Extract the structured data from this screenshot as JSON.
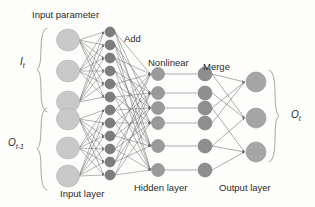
{
  "figure": {
    "type": "neural-network-architecture-diagram",
    "background_color": "#fdfdfc",
    "width": 315,
    "height": 207
  },
  "labels": {
    "input_parameter": "Input parameter",
    "add": "Add",
    "nonlinear": "Nonlinear",
    "merge": "Merge",
    "input_layer": "Input layer",
    "hidden_layer": "Hidden layer",
    "output_layer": "Output layer",
    "input_current": "I",
    "input_current_sub": "t",
    "input_previous": "O",
    "input_previous_sub": "t-1",
    "output": "O",
    "output_sub": "t"
  },
  "colors": {
    "input_node": "#c9c9c9",
    "input_node_stroke": "#b4b4b4",
    "add_node": "#7d7d7d",
    "add_node_stroke": "#6a6a6a",
    "nonlinear_node": "#9a9a9a",
    "nonlinear_node_stroke": "#858585",
    "merge_node": "#8e8e8e",
    "merge_node_stroke": "#7a7a7a",
    "output_node": "#a5a5a5",
    "output_node_stroke": "#909090",
    "edge": "#6b6b6b",
    "brace": "#9d9d9d",
    "text": "#2b2b2b"
  },
  "chart_data": {
    "type": "diagram",
    "columns": [
      {
        "name": "input-layer",
        "label": "Input layer",
        "x": 68,
        "radius": 11,
        "groups": [
          {
            "name": "I_t",
            "count": 3,
            "y": [
              40,
              71,
              102
            ]
          },
          {
            "name": "O_t-1",
            "count": 3,
            "y": [
              119,
              148,
              176
            ]
          }
        ]
      },
      {
        "name": "add-column",
        "label": "Add",
        "x": 110,
        "radius": 5,
        "groups": [
          {
            "name": "add-top",
            "count": 6,
            "y": [
              32,
              45,
              58,
              71,
              84,
              97
            ]
          },
          {
            "name": "add-bottom",
            "count": 6,
            "y": [
              110,
              123,
              136,
              149,
              162,
              175
            ]
          }
        ]
      },
      {
        "name": "nonlinear-column",
        "label": "Nonlinear",
        "x": 158,
        "radius": 6.5,
        "groups": [
          {
            "name": "nonlinear",
            "count": 6,
            "y": [
              74,
              93,
              108,
              123,
              146,
              170
            ]
          }
        ]
      },
      {
        "name": "merge-column",
        "label": "Merge",
        "x": 205,
        "radius": 7,
        "groups": [
          {
            "name": "merge",
            "count": 6,
            "y": [
              74,
              93,
              108,
              123,
              146,
              170
            ]
          }
        ]
      },
      {
        "name": "output-layer",
        "label": "Output layer",
        "x": 256,
        "radius": 10,
        "groups": [
          {
            "name": "O_t",
            "count": 3,
            "y": [
              82,
              118,
              152
            ]
          }
        ]
      }
    ],
    "edges": [
      {
        "from": "input-layer",
        "to": "add-column",
        "pattern": "fully-connected-within-group"
      },
      {
        "from": "add-column",
        "to": "nonlinear-column",
        "pattern": "crossing-bundles"
      },
      {
        "from": "nonlinear-column",
        "to": "merge-column",
        "pattern": "one-to-one-horizontal"
      },
      {
        "from": "merge-column",
        "to": "output-layer",
        "pattern": "crossing-to-outputs"
      }
    ],
    "braces": [
      {
        "name": "brace-input-current",
        "label": "I_t",
        "side": "left",
        "x": 38,
        "y_top": 28,
        "y_bottom": 112
      },
      {
        "name": "brace-input-previous",
        "label": "O_t-1",
        "side": "left",
        "x": 38,
        "y_top": 108,
        "y_bottom": 190
      },
      {
        "name": "brace-output",
        "label": "O_t",
        "side": "right",
        "x": 278,
        "y_top": 70,
        "y_bottom": 162
      }
    ]
  }
}
